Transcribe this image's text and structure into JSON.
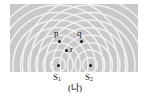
{
  "figure": {
    "caption": "(나)",
    "panel": {
      "background_color": "#c9c9c9",
      "wavefront_color": "#f2f2f2"
    },
    "sources": [
      {
        "id": "s1",
        "label_base": "S",
        "label_sub": "1",
        "x": 58,
        "y": 65
      },
      {
        "id": "s2",
        "label_base": "S",
        "label_sub": "2",
        "x": 90,
        "y": 65
      }
    ],
    "points": [
      {
        "id": "p",
        "label": "p",
        "x": 60,
        "y": 41,
        "label_x": 56,
        "label_y": 30
      },
      {
        "id": "q",
        "label": "q",
        "x": 82,
        "y": 41,
        "label_x": 79,
        "label_y": 30
      },
      {
        "id": "r",
        "label": "r",
        "x": 66,
        "y": 48,
        "label_x": 69,
        "label_y": 44
      }
    ],
    "wave_geometry": {
      "source1_center_x": 58,
      "source2_center_x": 90,
      "center_y": 65,
      "ring_spacing": 7.5,
      "ring_count": 9,
      "stroke_width": 1.6
    }
  }
}
